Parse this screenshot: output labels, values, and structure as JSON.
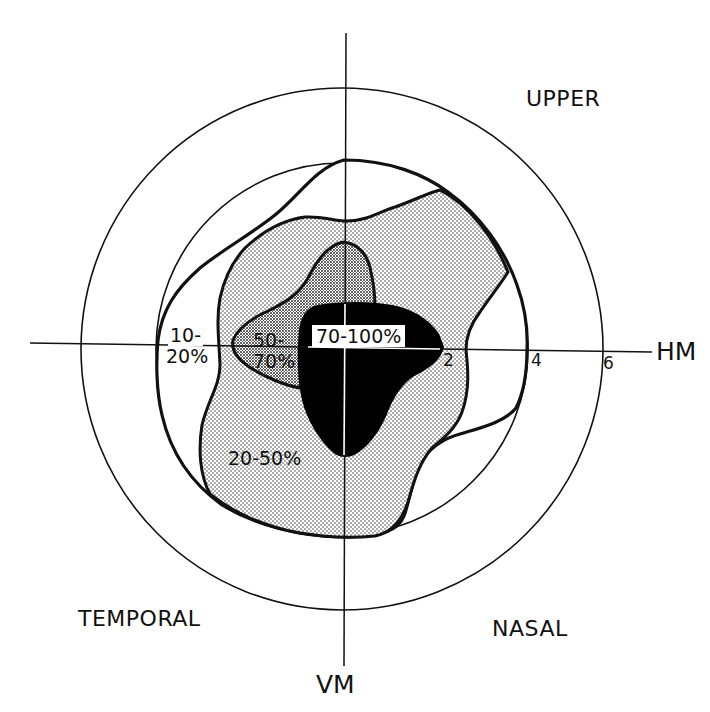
{
  "figure": {
    "type": "visual field map",
    "axes": {
      "horizontal_label": "HM",
      "vertical_label": "VM"
    },
    "quadrant_labels": {
      "upper": "UPPER",
      "temporal": "TEMPORAL",
      "nasal": "NASAL"
    },
    "eccentricity_ticks": [
      "2",
      "4",
      "6"
    ],
    "zones": [
      {
        "id": "z1",
        "label_line1": "10-",
        "label_line2": "20%",
        "fill": "white"
      },
      {
        "id": "z2",
        "label": "20-50%",
        "fill": "light-stipple"
      },
      {
        "id": "z3",
        "label_line1": "50-",
        "label_line2": "70%",
        "fill": "dense-stipple"
      },
      {
        "id": "z4",
        "label": "70-100%",
        "fill": "black"
      }
    ],
    "colors": {
      "line": "#111111",
      "solid": "#000000",
      "background": "#ffffff"
    }
  }
}
